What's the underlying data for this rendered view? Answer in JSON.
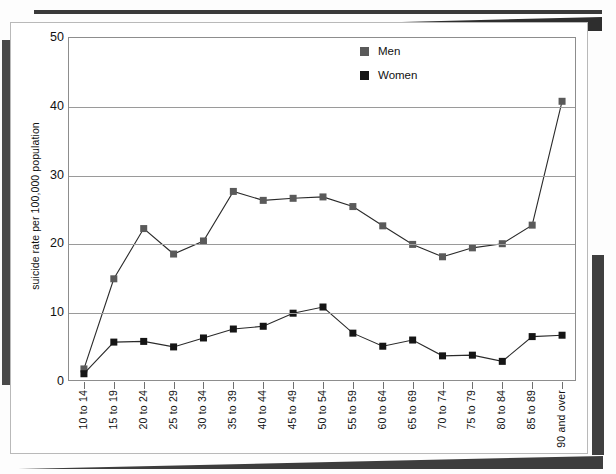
{
  "chart_data": {
    "type": "line",
    "title": "",
    "subtitle": "",
    "xlabel": "",
    "ylabel": "suicide rate per 100,000 population",
    "ylim": [
      0,
      50
    ],
    "yticks": [
      0,
      10,
      20,
      30,
      40,
      50
    ],
    "grid": true,
    "legend_position": "top-center",
    "categories": [
      "10 to 14",
      "15 to 19",
      "20 to 24",
      "25 to 29",
      "30 to 34",
      "35 to 39",
      "40 to 44",
      "45 to 49",
      "50 to 54",
      "55 to 59",
      "60 to 64",
      "65 to 69",
      "70 to 74",
      "75 to 79",
      "80 to 84",
      "85 to 89",
      "90 and over"
    ],
    "series": [
      {
        "name": "Men",
        "color": "#5a5a5a",
        "marker": "square",
        "values": [
          1.9,
          15.0,
          22.3,
          18.6,
          20.5,
          27.7,
          26.4,
          26.7,
          26.9,
          25.5,
          22.7,
          20.0,
          18.2,
          19.5,
          20.1,
          22.8,
          40.8
        ]
      },
      {
        "name": "Women",
        "color": "#151515",
        "marker": "square",
        "values": [
          1.2,
          5.8,
          5.9,
          5.1,
          6.4,
          7.7,
          8.1,
          10.0,
          10.9,
          7.1,
          5.2,
          6.1,
          3.8,
          3.9,
          3.0,
          6.6,
          6.8
        ]
      }
    ]
  },
  "legend": {
    "items": [
      {
        "label": "Men",
        "color": "#5a5a5a"
      },
      {
        "label": "Women",
        "color": "#151515"
      }
    ]
  }
}
